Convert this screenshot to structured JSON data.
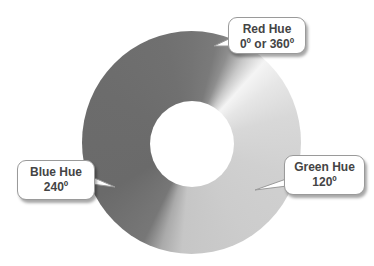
{
  "diagram": {
    "type": "hue-color-wheel (grayscale)",
    "callouts": [
      {
        "id": "red",
        "title": "Red Hue",
        "value": "0º or 360º"
      },
      {
        "id": "green",
        "title": "Green Hue",
        "value": "120º"
      },
      {
        "id": "blue",
        "title": "Blue Hue",
        "value": "240º"
      }
    ]
  }
}
